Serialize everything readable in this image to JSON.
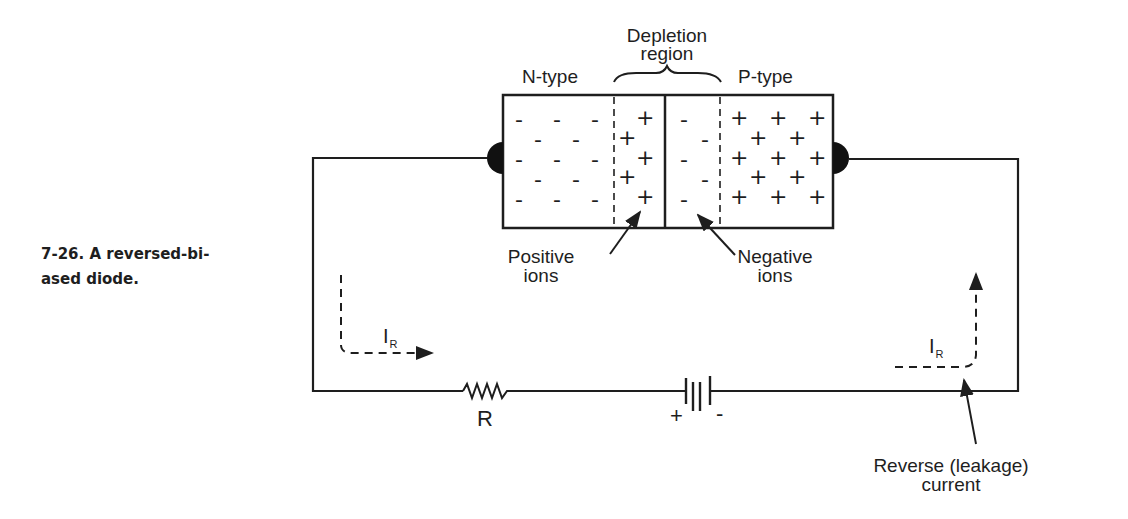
{
  "caption": {
    "number": "7-26.",
    "line1": "7-26.  A  reversed-bi-",
    "line2": "ased diode."
  },
  "diagram": {
    "labels": {
      "depletion_line1": "Depletion",
      "depletion_line2": "region",
      "n_type": "N-type",
      "p_type": "P-type",
      "positive_line1": "Positive",
      "positive_line2": "ions",
      "negative_line1": "Negative",
      "negative_line2": "ions",
      "resistor": "R",
      "battery_plus": "+",
      "battery_minus": "-",
      "current_left_main": "I",
      "current_left_sub": "R",
      "current_right_main": "I",
      "current_right_sub": "R",
      "leakage_line1": "Reverse (leakage)",
      "leakage_line2": "current"
    },
    "charges": {
      "n_region_majority": "-",
      "n_depletion_ions": "+",
      "p_depletion_ions": "-",
      "p_region_majority": "+"
    },
    "colors": {
      "ink": "#1e1e1e",
      "background": "#ffffff"
    }
  }
}
